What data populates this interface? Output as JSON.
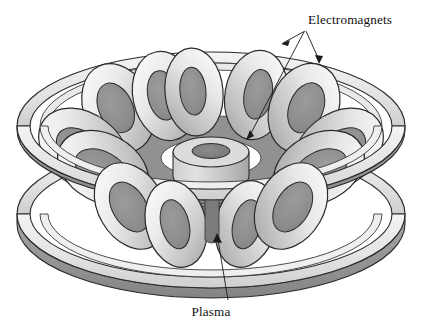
{
  "figure": {
    "title_alt": "Tokamak fusion reactor cutaway diagram",
    "background_color": "#ffffff"
  },
  "labels": {
    "electromagnets": "Electromagnets",
    "plasma": "Plasma"
  },
  "palette": {
    "outline": "#1a1a1a",
    "ring_top_light": "#ededed",
    "ring_top_mid": "#dcdcdc",
    "ring_side_dark": "#8f8f8f",
    "ring_side_mid": "#b4b4b4",
    "coil_highlight": "#f2f2f2",
    "coil_light": "#e0e0e0",
    "coil_mid": "#bdbdbd",
    "coil_shade": "#9a9a9a",
    "plasma_gray": "#8a8a8a",
    "plasma_dark": "#6f6f6f",
    "hub_light": "#dadada",
    "hub_mid": "#b0b0b0",
    "hub_hole": "#7d7d7d",
    "white": "#ffffff"
  },
  "geometry": {
    "center_x": 211,
    "upper_ring_cy": 126,
    "lower_ring_cy": 214,
    "ring_rx": 194,
    "ring_ry": 74,
    "ring_band": 13,
    "inner_ring_rx": 171,
    "inner_ring_ry": 63,
    "coil_count": 12,
    "hub_cx": 211,
    "hub_cy": 152,
    "hub_rx": 38,
    "hub_ry": 15,
    "hub_height": 30
  },
  "annotations": {
    "electromagnets_label_x": 308,
    "electromagnets_label_y": 24,
    "electromagnets_anchor_x": 305,
    "electromagnets_anchor_y": 31,
    "arrow_targets": [
      {
        "name": "upper-hoop-ring",
        "x": 281,
        "y": 44
      },
      {
        "name": "right-coil",
        "x": 319,
        "y": 63
      },
      {
        "name": "near-hub-coil",
        "x": 246,
        "y": 139
      }
    ],
    "plasma_label_x": 211,
    "plasma_label_y": 314,
    "plasma_target_x": 217,
    "plasma_target_y": 234
  }
}
